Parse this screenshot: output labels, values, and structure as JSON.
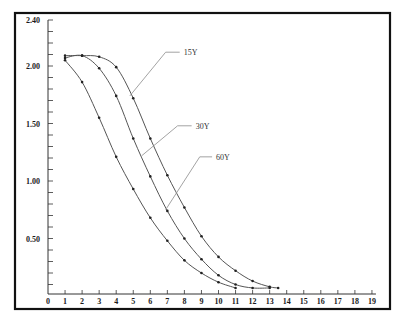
{
  "chart_data": {
    "type": "line",
    "title": "",
    "xlabel": "",
    "ylabel": "",
    "xlim": [
      0,
      19
    ],
    "ylim": [
      0,
      2.4
    ],
    "grid": false,
    "legend": "inline leader-line labels",
    "x_ticks": [
      0,
      1,
      2,
      3,
      4,
      5,
      6,
      7,
      8,
      9,
      10,
      11,
      12,
      13,
      14,
      15,
      16,
      17,
      18,
      19
    ],
    "y_tick_labels": [
      {
        "value": 0.5,
        "label": "0.50"
      },
      {
        "value": 1.0,
        "label": "1.00"
      },
      {
        "value": 1.5,
        "label": "1.50"
      },
      {
        "value": 2.0,
        "label": "2.00"
      },
      {
        "value": 2.4,
        "label": "2.40"
      }
    ],
    "y_minor_step": 0.1,
    "series": [
      {
        "name": "15Y",
        "x": [
          1,
          2,
          3,
          4,
          5,
          6,
          7,
          8,
          9,
          10,
          11,
          12,
          13,
          13.5
        ],
        "values": [
          2.09,
          2.09,
          2.08,
          1.99,
          1.72,
          1.37,
          1.05,
          0.77,
          0.52,
          0.34,
          0.22,
          0.13,
          0.08,
          0.07
        ],
        "label_anchor": {
          "x": 4.8,
          "y": 1.74
        },
        "label_elbow": {
          "x": 6.9,
          "y": 2.12
        },
        "label_pos": {
          "x": 7.9,
          "y": 2.12
        }
      },
      {
        "name": "30Y",
        "x": [
          1,
          2,
          3,
          4,
          5,
          6,
          7,
          8,
          9,
          10,
          11,
          12,
          13
        ],
        "values": [
          2.07,
          2.09,
          1.98,
          1.74,
          1.37,
          1.04,
          0.74,
          0.5,
          0.32,
          0.18,
          0.1,
          0.07,
          0.07
        ],
        "label_anchor": {
          "x": 5.5,
          "y": 1.22
        },
        "label_elbow": {
          "x": 7.6,
          "y": 1.48
        },
        "label_pos": {
          "x": 8.6,
          "y": 1.48
        }
      },
      {
        "name": "60Y",
        "x": [
          1,
          2,
          3,
          4,
          5,
          6,
          7,
          8,
          9,
          10,
          11
        ],
        "values": [
          2.05,
          1.86,
          1.55,
          1.21,
          0.93,
          0.68,
          0.48,
          0.31,
          0.2,
          0.12,
          0.07
        ],
        "label_anchor": {
          "x": 6.9,
          "y": 0.75
        },
        "label_elbow": {
          "x": 8.9,
          "y": 1.21
        },
        "label_pos": {
          "x": 9.8,
          "y": 1.21
        }
      }
    ],
    "colors": {
      "frame": "#111111",
      "axis": "#333333",
      "curve": "#555555",
      "marker": "#222222",
      "leader": "#999999"
    }
  }
}
